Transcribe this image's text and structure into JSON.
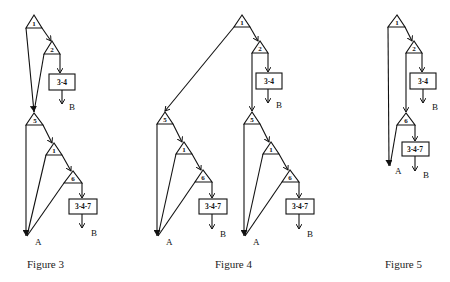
{
  "figures": [
    {
      "caption": "Figure 3",
      "nodes": {
        "n1": "1",
        "n2": "2",
        "box34": "3-4",
        "n5": "5",
        "n1b": "1",
        "n6": "6",
        "box347": "3-4-7"
      },
      "outputs": {
        "b1": "B",
        "a": "A",
        "b2": "B"
      }
    },
    {
      "caption": "Figure 4",
      "nodes": {
        "n1": "1",
        "n2": "2",
        "box34": "3-4",
        "n5left": "5",
        "n1left": "1",
        "n6left": "6",
        "box347left": "3-4-7",
        "n5right": "5",
        "n1right": "1",
        "n6right": "6",
        "box347right": "3-4-7"
      },
      "outputs": {
        "b1": "B",
        "aleft": "A",
        "bleft": "B",
        "aright": "A",
        "bright": "B"
      }
    },
    {
      "caption": "Figure 5",
      "nodes": {
        "n1": "1",
        "n2": "2",
        "box34": "3-4",
        "n6": "6",
        "box347": "3-4-7"
      },
      "outputs": {
        "b1": "B",
        "a": "A",
        "b2": "B"
      }
    }
  ]
}
